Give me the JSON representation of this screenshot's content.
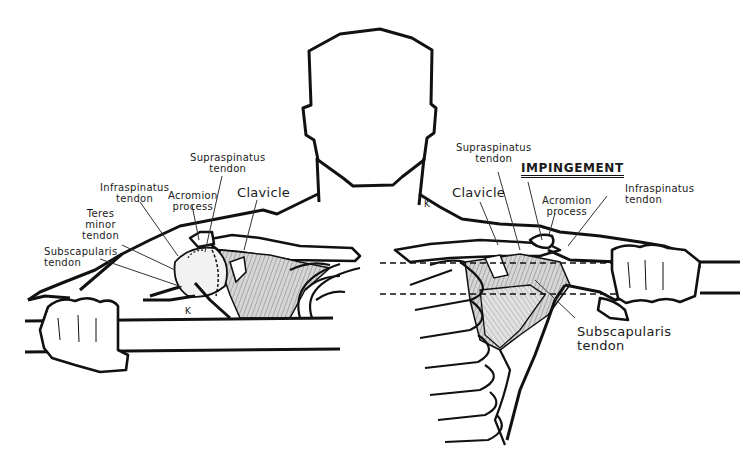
{
  "figure": {
    "title": "IMPINGEMENT",
    "signature": "K",
    "colors": {
      "ink": "#111111",
      "leader": "#333333",
      "shade": "#9a9a9a",
      "background": "#ffffff"
    }
  },
  "left_view": {
    "labels": [
      {
        "id": "supraspinatus",
        "text": "Supraspinatus\ntendon"
      },
      {
        "id": "infraspinatus",
        "text": "Infraspinatus\ntendon"
      },
      {
        "id": "acromion",
        "text": "Acromion\nprocess"
      },
      {
        "id": "clavicle",
        "text": "Clavicle"
      },
      {
        "id": "teres-minor",
        "text": "Teres\nminor\ntendon"
      },
      {
        "id": "subscapularis",
        "text": "Subscapularis\ntendon"
      }
    ]
  },
  "right_view": {
    "labels": [
      {
        "id": "supraspinatus",
        "text": "Supraspinatus\ntendon"
      },
      {
        "id": "clavicle",
        "text": "Clavicle"
      },
      {
        "id": "acromion",
        "text": "Acromion\nprocess"
      },
      {
        "id": "infraspinatus",
        "text": "Infraspinatus\ntendon"
      },
      {
        "id": "subscapularis",
        "text": "Subscapularis\ntendon"
      }
    ]
  }
}
